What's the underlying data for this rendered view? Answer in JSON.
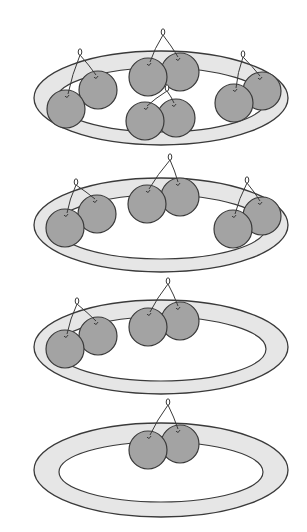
{
  "figure": {
    "colors": {
      "background": "#ffffff",
      "plate_rim": "#e6e6e6",
      "plate_center": "#ffffff",
      "outline": "#3a3a3a",
      "cherry": "#a3a3a3",
      "stem": "#3a3a3a"
    },
    "plates": [
      {
        "id": "plate-1",
        "cx": 161,
        "cy": 98,
        "rx": 127,
        "ry": 47,
        "irx": 105,
        "iry": 32,
        "cherry_pairs": [
          {
            "a": [
              66,
              109
            ],
            "b": [
              98,
              90
            ],
            "knot": [
              80,
              55
            ]
          },
          {
            "a": [
              148,
              77
            ],
            "b": [
              180,
              72
            ],
            "knot": [
              163,
              35
            ]
          },
          {
            "a": [
              145,
              121
            ],
            "b": [
              176,
              118
            ],
            "knot": [
              167,
              91
            ]
          },
          {
            "a": [
              234,
              103
            ],
            "b": [
              262,
              91
            ],
            "knot": [
              243,
              57
            ]
          }
        ]
      },
      {
        "id": "plate-2",
        "cx": 161,
        "cy": 225,
        "rx": 127,
        "ry": 47,
        "irx": 105,
        "iry": 32,
        "cherry_pairs": [
          {
            "a": [
              65,
              228
            ],
            "b": [
              97,
              214
            ],
            "knot": [
              76,
              185
            ]
          },
          {
            "a": [
              147,
              204
            ],
            "b": [
              180,
              197
            ],
            "knot": [
              170,
              160
            ]
          },
          {
            "a": [
              233,
              229
            ],
            "b": [
              262,
              216
            ],
            "knot": [
              247,
              183
            ]
          }
        ]
      },
      {
        "id": "plate-3",
        "cx": 161,
        "cy": 347,
        "rx": 127,
        "ry": 47,
        "irx": 105,
        "iry": 32,
        "cherry_pairs": [
          {
            "a": [
              65,
              349
            ],
            "b": [
              98,
              336
            ],
            "knot": [
              77,
              304
            ]
          },
          {
            "a": [
              148,
              327
            ],
            "b": [
              180,
              321
            ],
            "knot": [
              168,
              284
            ]
          }
        ]
      },
      {
        "id": "plate-4",
        "cx": 161,
        "cy": 470,
        "rx": 127,
        "ry": 47,
        "irx": 102,
        "iry": 30,
        "cherry_pairs": [
          {
            "a": [
              148,
              450
            ],
            "b": [
              180,
              444
            ],
            "knot": [
              168,
              405
            ]
          }
        ]
      }
    ],
    "cherry_radius": 19
  }
}
